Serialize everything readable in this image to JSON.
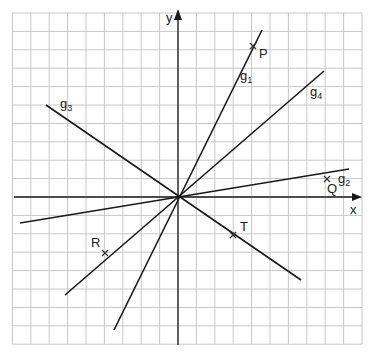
{
  "diagram": {
    "type": "coordinate-system",
    "grid": {
      "origin_px": [
        178,
        197
      ],
      "step_px": 18.4,
      "x_range_units": [
        -9,
        10
      ],
      "y_range_units": [
        -8,
        10
      ],
      "line_color": "#c8c8c8"
    },
    "axes": {
      "x_label": "x",
      "y_label": "y",
      "color": "#1a1a1a"
    },
    "lines": [
      {
        "name": "g",
        "subscript": "1",
        "from": [
          114,
          330
        ],
        "to": [
          262,
          30
        ],
        "label_pos": [
          240,
          80
        ]
      },
      {
        "name": "g",
        "subscript": "2",
        "from": [
          20,
          223
        ],
        "to": [
          349,
          169
        ],
        "label_pos": [
          338,
          183
        ]
      },
      {
        "name": "g",
        "subscript": "3",
        "from": [
          46,
          105
        ],
        "to": [
          301,
          280
        ],
        "label_pos": [
          60,
          108
        ]
      },
      {
        "name": "g",
        "subscript": "4",
        "from": [
          65,
          295
        ],
        "to": [
          324,
          71
        ],
        "label_pos": [
          310,
          96
        ]
      }
    ],
    "points": [
      {
        "label": "P",
        "px": [
          253,
          46
        ],
        "label_pos": [
          259,
          58
        ]
      },
      {
        "label": "Q",
        "px": [
          327,
          179
        ],
        "label_pos": [
          327,
          193
        ]
      },
      {
        "label": "R",
        "px": [
          105,
          253
        ],
        "label_pos": [
          91,
          247
        ]
      },
      {
        "label": "T",
        "px": [
          233,
          235
        ],
        "label_pos": [
          240,
          231
        ]
      }
    ],
    "line_color": "#1a1a1a"
  }
}
